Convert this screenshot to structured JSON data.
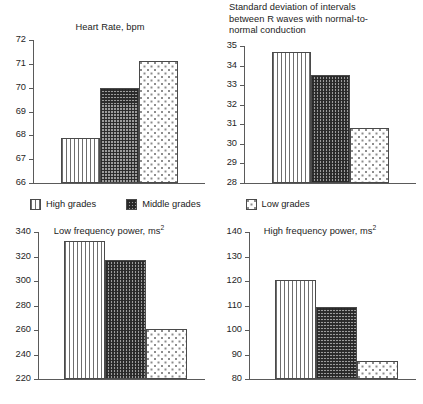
{
  "legend": {
    "items": [
      {
        "label": "High grades",
        "pattern": "vertical-lines"
      },
      {
        "label": "Middle grades",
        "pattern": "dark-checker"
      },
      {
        "label": "Low grades",
        "pattern": "sparse-dots"
      }
    ]
  },
  "chart_data": [
    {
      "type": "bar",
      "title": "Heart Rate, bpm",
      "xlabel": "",
      "ylabel": "",
      "categories": [
        "High grades",
        "Middle grades",
        "Low grades"
      ],
      "values": [
        67.9,
        70.0,
        71.1
      ],
      "ylim": [
        66,
        72
      ],
      "yticks": [
        66,
        67,
        68,
        69,
        70,
        71,
        72
      ],
      "ytick_labels": [
        "66",
        "67",
        "68",
        "69",
        "70",
        "71",
        "72"
      ],
      "grid": false,
      "legend_position": "below-figure"
    },
    {
      "type": "bar",
      "title": "Standard deviation of intervals\nbetween R waves with normal-to-\nnormal conduction",
      "xlabel": "",
      "ylabel": "",
      "categories": [
        "High grades",
        "Middle grades",
        "Low grades"
      ],
      "values": [
        34.7,
        33.5,
        30.8
      ],
      "ylim": [
        28,
        35
      ],
      "yticks": [
        28,
        29,
        30,
        31,
        32,
        33,
        34,
        35
      ],
      "ytick_labels": [
        "28",
        "29",
        "30",
        "31",
        "32",
        "33",
        "34",
        "35"
      ],
      "grid": false,
      "legend_position": "below-figure"
    },
    {
      "type": "bar",
      "title": "Low frequency power, ms2",
      "title_base": "Low frequency power, ms",
      "title_sup": "2",
      "xlabel": "",
      "ylabel": "",
      "categories": [
        "High grades",
        "Middle grades",
        "Low grades"
      ],
      "values": [
        333,
        317,
        261
      ],
      "ylim": [
        220,
        340
      ],
      "yticks": [
        220,
        240,
        260,
        280,
        300,
        320,
        340
      ],
      "ytick_labels": [
        "220",
        "240",
        "260",
        "280",
        "300",
        "320",
        "340"
      ],
      "grid": false,
      "legend_position": "above-figure"
    },
    {
      "type": "bar",
      "title": "High frequency power, ms2",
      "title_base": "High frequency power, ms",
      "title_sup": "2",
      "xlabel": "",
      "ylabel": "",
      "categories": [
        "High grades",
        "Middle grades",
        "Low grades"
      ],
      "values": [
        120.3,
        109.5,
        87.5
      ],
      "ylim": [
        80,
        140
      ],
      "yticks": [
        80,
        90,
        100,
        110,
        120,
        130,
        140
      ],
      "ytick_labels": [
        "80",
        "90",
        "100",
        "110",
        "120",
        "130",
        "140"
      ],
      "grid": false,
      "legend_position": "above-figure"
    }
  ]
}
